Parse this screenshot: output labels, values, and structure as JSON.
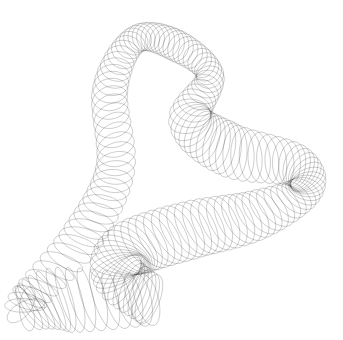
{
  "canvas": {
    "width": 343,
    "height": 340,
    "background": "#ffffff"
  },
  "artwork": {
    "description": "Harmonograph-style line drawing: ribbon of overlapping elliptical loops forming a twisted cone/shell shape",
    "stroke_color": "#3a3a3a",
    "stroke_opacity": 0.55,
    "stroke_width": 0.45,
    "loops": 150,
    "samples_per_loop": 28,
    "path_points": [
      [
        150,
        300
      ],
      [
        60,
        300
      ],
      [
        25,
        305
      ],
      [
        80,
        240
      ],
      [
        115,
        170
      ],
      [
        110,
        90
      ],
      [
        135,
        40
      ],
      [
        175,
        45
      ],
      [
        210,
        75
      ],
      [
        190,
        120
      ],
      [
        230,
        150
      ],
      [
        295,
        165
      ],
      [
        305,
        190
      ],
      [
        255,
        215
      ],
      [
        190,
        230
      ],
      [
        130,
        250
      ],
      [
        120,
        275
      ],
      [
        150,
        300
      ]
    ],
    "radius_points": [
      [
        26,
        10
      ],
      [
        34,
        8
      ],
      [
        20,
        6
      ],
      [
        22,
        10
      ],
      [
        20,
        14
      ],
      [
        18,
        14
      ],
      [
        14,
        12
      ],
      [
        16,
        14
      ],
      [
        14,
        12
      ],
      [
        22,
        16
      ],
      [
        28,
        14
      ],
      [
        22,
        12
      ],
      [
        18,
        10
      ],
      [
        26,
        14
      ],
      [
        30,
        16
      ],
      [
        30,
        16
      ],
      [
        28,
        12
      ],
      [
        26,
        10
      ]
    ]
  }
}
